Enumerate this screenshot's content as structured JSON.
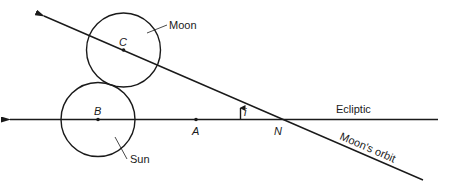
{
  "diagram": {
    "labels": {
      "moon": "Moon",
      "sun": "Sun",
      "ecliptic": "Ecliptic",
      "moons_orbit": "Moon's orbit",
      "angle": "i"
    },
    "points": {
      "C": "C",
      "B": "B",
      "A": "A",
      "N": "N"
    },
    "colors": {
      "stroke": "#1a1a1a",
      "background": "#ffffff"
    }
  }
}
